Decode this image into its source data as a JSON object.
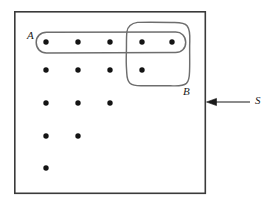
{
  "figure": {
    "kind": "set-diagram",
    "background_color": "#ffffff",
    "line_color": "#333333",
    "dot_color": "#141414",
    "labels": {
      "set_a": "A",
      "set_b": "B",
      "universe_s": "S"
    },
    "universe_box": {
      "name": "S",
      "x": 14,
      "y": 11,
      "width": 192,
      "height": 183,
      "stroke": "#3a3a3a",
      "stroke_width": 1.6
    },
    "set_a_capsule": {
      "name": "A",
      "x": 36,
      "y": 32,
      "width": 150,
      "height": 21,
      "corner_radius": 10,
      "stroke": "#6e6e6e",
      "stroke_width": 1.4
    },
    "set_b_blob": {
      "name": "B",
      "x": 126,
      "y": 22,
      "width": 64,
      "height": 64,
      "stroke": "#6e6e6e",
      "stroke_width": 1.4
    },
    "pointer": {
      "name": "S",
      "from_x": 250,
      "to_x": 207,
      "y": 102,
      "stroke": "#1a1a1a",
      "stroke_width": 1.1
    },
    "dot_radius": 2.6,
    "dot_rows": [
      {
        "y": 42,
        "xs": [
          46,
          78,
          110,
          142,
          172
        ],
        "count": 5,
        "in_a": true
      },
      {
        "y": 70,
        "xs": [
          46,
          78,
          110,
          142
        ],
        "count": 4,
        "in_a": false
      },
      {
        "y": 103,
        "xs": [
          46,
          78,
          110
        ],
        "count": 3,
        "in_a": false
      },
      {
        "y": 136,
        "xs": [
          46,
          78
        ],
        "count": 2,
        "in_a": false
      },
      {
        "y": 168,
        "xs": [
          46
        ],
        "count": 1,
        "in_a": false
      }
    ],
    "total_points": 15,
    "points_in_a": 5,
    "points_in_b": 3,
    "points_in_a_and_b": 2
  }
}
